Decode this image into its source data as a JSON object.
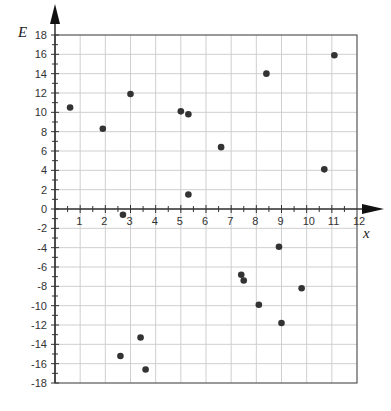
{
  "chart_data": {
    "type": "scatter",
    "title": "",
    "xlabel": "x",
    "ylabel": "E",
    "xlim": [
      0,
      12
    ],
    "ylim": [
      -18,
      18
    ],
    "x_ticks": [
      1,
      2,
      3,
      4,
      5,
      6,
      7,
      8,
      9,
      10,
      11,
      12
    ],
    "y_ticks": [
      18,
      16,
      14,
      12,
      10,
      8,
      6,
      4,
      2,
      0,
      -2,
      -4,
      -6,
      -8,
      -10,
      -12,
      -14,
      -16,
      -18
    ],
    "x_major_step": 1,
    "y_major_step": 2,
    "grid": true,
    "legend": null,
    "series": [
      {
        "name": "points",
        "color": "#333333",
        "points": [
          {
            "x": 0.6,
            "y": 10.5
          },
          {
            "x": 1.9,
            "y": 8.3
          },
          {
            "x": 3.0,
            "y": 11.9
          },
          {
            "x": 5.0,
            "y": 10.1
          },
          {
            "x": 5.3,
            "y": 9.8
          },
          {
            "x": 5.3,
            "y": 1.5
          },
          {
            "x": 6.6,
            "y": 6.4
          },
          {
            "x": 8.4,
            "y": 14.0
          },
          {
            "x": 10.7,
            "y": 4.1
          },
          {
            "x": 11.1,
            "y": 15.9
          },
          {
            "x": 2.7,
            "y": -0.6
          },
          {
            "x": 3.4,
            "y": -13.3
          },
          {
            "x": 2.6,
            "y": -15.2
          },
          {
            "x": 3.6,
            "y": -16.6
          },
          {
            "x": 8.9,
            "y": -3.9
          },
          {
            "x": 7.4,
            "y": -6.8
          },
          {
            "x": 7.5,
            "y": -7.4
          },
          {
            "x": 9.8,
            "y": -8.2
          },
          {
            "x": 8.1,
            "y": -9.9
          },
          {
            "x": 9.0,
            "y": -11.8
          }
        ]
      }
    ]
  },
  "style": {
    "grid_color": "#cfcfcf",
    "axis_color": "#333333",
    "frame_color": "#555555",
    "point_color": "#333333"
  }
}
